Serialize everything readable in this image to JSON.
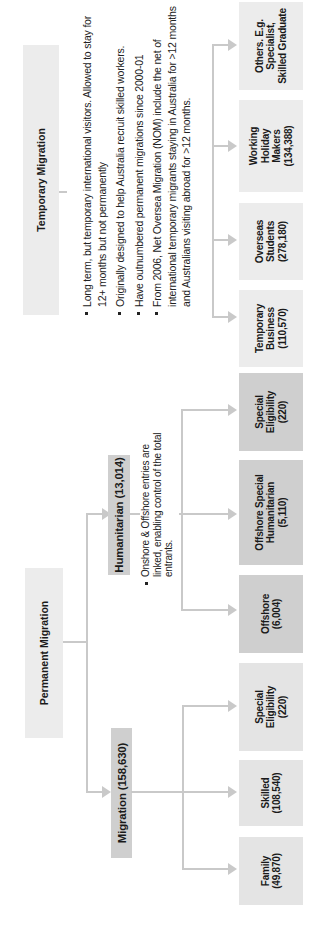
{
  "colors": {
    "box_fill": "#e4e4e4",
    "box_fill_dark": "#cfcfcf",
    "connector": "#c9c9c9",
    "text": "#1a1a1a"
  },
  "orientation": "rotated-90-ccw",
  "permanent": {
    "title": "Permanent Migration",
    "migration": {
      "label": "Migration (158,630)",
      "children": [
        {
          "name": "Family",
          "value": "(49,870)"
        },
        {
          "name": "Skilled",
          "value": "(108,540)"
        },
        {
          "name": "Special Eligibility",
          "value": "(220)"
        }
      ]
    },
    "humanitarian": {
      "label": "Humanitarian (13,014)",
      "note": "Onshore & Offshore entries are linked, enabling control of the total entrants.",
      "children": [
        {
          "name": "Offshore",
          "value": "(6,004)"
        },
        {
          "name": "Offshore Special Humanitarian",
          "value": "(5,110)"
        },
        {
          "name": "Special Eligibility",
          "value": "(220)"
        }
      ]
    }
  },
  "temporary": {
    "title": "Temporary Migration",
    "notes": [
      "Long term, but temporary international visitors. Allowed to stay for 12+ months but not permanently",
      "Originally designed to help Australia recruit skilled workers.",
      "Have outnumbered permanent migrations since 2000-01",
      "From 2006, Net Oversea Migration (NOM) include the net of international temporary migrants staying in Australia for >12 months and Australians visiting abroad for >12 months."
    ],
    "children": [
      {
        "name": "Temporary Business",
        "value": "(110,570)"
      },
      {
        "name": "Overseas Students",
        "value": "(278,180)"
      },
      {
        "name": "Working Holiday Makers",
        "value": "(134,388)"
      },
      {
        "name": "Others. E.g. Specialist, Skilled Graduate",
        "value": ""
      }
    ]
  }
}
